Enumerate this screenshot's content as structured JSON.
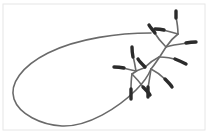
{
  "figure": {
    "background_color": "#ffffff",
    "frame_color": "#e6e6e6",
    "stroke_color": "#6a6a6a",
    "bud_color": "#2b2b2b",
    "stroke_width": 1.6,
    "bud_width": 3.4,
    "canvas": {
      "width": 209,
      "height": 140
    }
  },
  "frame": {
    "x": 3,
    "y": 4,
    "width": 202,
    "height": 126
  },
  "loop": {
    "label": "elongated-closed-loop",
    "path": "M 151 33 C 120 33, 78 38, 48 53 C 22 66, 9 84, 14 99 C 19 114, 41 125, 62 126 C 88 127, 118 108, 136 90 C 144 82, 149 74, 151 69"
  },
  "stem": {
    "label": "main-stem",
    "path": "M 151 69 C 156 63, 161 55, 166 47 C 170 41, 174 37, 178 34"
  },
  "branches": [
    {
      "name": "branch-upper-right-long",
      "path": "M 166 47 C 173 45, 181 44, 188 43"
    },
    {
      "name": "branch-upper-left-short",
      "path": "M 166 47 C 161 42, 157 37, 154 32"
    },
    {
      "name": "branch-top-vertical",
      "path": "M 178 34 C 178 28, 177 22, 176 17"
    },
    {
      "name": "branch-top-left",
      "path": "M 178 34 C 172 32, 167 31, 163 30"
    },
    {
      "name": "branch-mid-right",
      "path": "M 159 57 C 166 57, 172 58, 177 60"
    },
    {
      "name": "branch-mid-left-down",
      "path": "M 159 57 C 153 60, 148 64, 144 68"
    },
    {
      "name": "branch-lower-right",
      "path": "M 151 69 C 157 72, 162 76, 166 80"
    },
    {
      "name": "branch-lower-down",
      "path": "M 151 69 C 150 76, 149 82, 148 88"
    },
    {
      "name": "branch-cluster-stem",
      "path": "M 144 68 C 140 69, 136 71, 132 74"
    },
    {
      "name": "branch-cluster-up",
      "path": "M 136 71 C 135 65, 134 60, 133 56"
    },
    {
      "name": "branch-cluster-left",
      "path": "M 136 71 C 131 70, 127 69, 123 68"
    },
    {
      "name": "branch-cluster-down",
      "path": "M 132 74 C 131 80, 131 85, 131 90"
    },
    {
      "name": "branch-cluster-downright",
      "path": "M 132 74 C 137 79, 141 84, 144 88"
    }
  ],
  "buds": [
    {
      "name": "bud-top-vertical",
      "path": "M 176 18 C 176 14, 176 12, 176 11"
    },
    {
      "name": "bud-top-left",
      "path": "M 164 30 C 160 29, 157 29, 155 29"
    },
    {
      "name": "bud-upper-right-long",
      "path": "M 186 43 C 191 42, 194 42, 196 42"
    },
    {
      "name": "bud-upper-left-short",
      "path": "M 155 33 C 152 29, 150 27, 149 25"
    },
    {
      "name": "bud-mid-right",
      "path": "M 175 59 C 180 61, 184 63, 186 64"
    },
    {
      "name": "bud-mid-left-down",
      "path": "M 145 67 C 141 63, 139 61, 138 59"
    },
    {
      "name": "bud-lower-right",
      "path": "M 165 79 C 169 83, 171 85, 172 87"
    },
    {
      "name": "bud-lower-down",
      "path": "M 148 87 C 148 92, 148 95, 148 97"
    },
    {
      "name": "bud-cluster-up",
      "path": "M 133 57 C 132 52, 132 49, 132 47"
    },
    {
      "name": "bud-cluster-left",
      "path": "M 124 68 C 119 67, 116 67, 114 67"
    },
    {
      "name": "bud-cluster-down",
      "path": "M 131 89 C 131 94, 131 97, 131 99"
    },
    {
      "name": "bud-cluster-downright",
      "path": "M 143 87 C 147 91, 149 93, 150 95"
    }
  ]
}
